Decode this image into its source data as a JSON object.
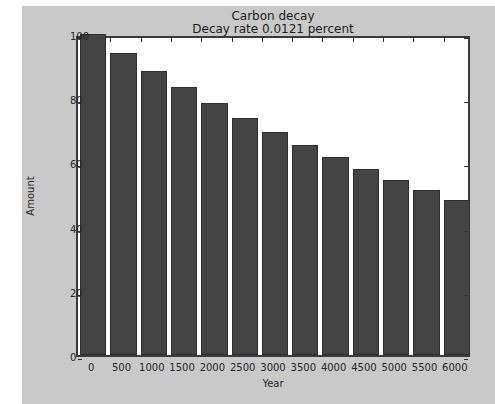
{
  "chart_data": {
    "type": "bar",
    "title": "Carbon decay",
    "subtitle": "Decay rate 0.0121 percent",
    "xlabel": "Year",
    "ylabel": "Amount",
    "categories": [
      0,
      500,
      1000,
      1500,
      2000,
      2500,
      3000,
      3500,
      4000,
      4500,
      5000,
      5500,
      6000
    ],
    "xtick_labels": [
      "0",
      "500",
      "1000",
      "1500",
      "2000",
      "2500",
      "3000",
      "3500",
      "4000",
      "4500",
      "5000",
      "5500",
      "6000"
    ],
    "values": [
      100.0,
      94.1,
      88.6,
      83.4,
      78.5,
      73.9,
      69.5,
      65.4,
      61.6,
      58.0,
      54.6,
      51.4,
      48.3
    ],
    "ytick_labels": [
      "0",
      "20",
      "40",
      "60",
      "80",
      "100"
    ],
    "yticks": [
      0,
      20,
      40,
      60,
      80,
      100
    ],
    "ylim": [
      0,
      100
    ],
    "grid": false,
    "legend": null,
    "bar_color": "#444444",
    "bar_edge_color": "#2e2e2e",
    "axes_background": "#ffffff",
    "figure_background": "#c9c9c9",
    "spine_color": "#3a3a3a",
    "text_color": "#262626"
  }
}
